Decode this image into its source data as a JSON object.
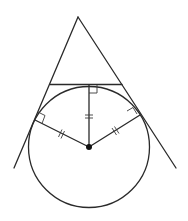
{
  "diagram": {
    "type": "geometry",
    "colors": {
      "stroke": "#2a2a2a",
      "background": "#ffffff",
      "center_dot": "#111111"
    },
    "apex": [
      78,
      17
    ],
    "left_line_end": [
      14,
      168
    ],
    "right_line_end": [
      176,
      168
    ],
    "horizontal_tangent": {
      "from": [
        50,
        84
      ],
      "to": [
        122,
        84
      ]
    },
    "circle": {
      "center": [
        89,
        147
      ],
      "radius": 60
    },
    "tangent_points": {
      "top": [
        89,
        86
      ],
      "left": [
        35,
        120
      ],
      "right": [
        140,
        115
      ]
    },
    "radii_marks": "double tick (equal lengths)",
    "right_angle_marks": 3
  }
}
